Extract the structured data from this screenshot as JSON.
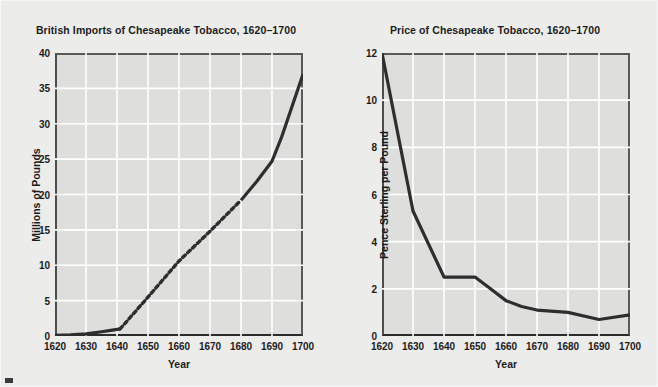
{
  "page": {
    "background_color": "#ececeb",
    "plot_background_color": "#dededc",
    "line_color": "#2e2e2e",
    "gridline_color": "#ffffff",
    "axis_color": "#2b2b2b",
    "text_color": "#1c1c1c"
  },
  "chart_data": [
    {
      "id": "imports",
      "type": "line",
      "title": "British Imports of Chesapeake Tobacco, 1620–1700",
      "xlabel": "Year",
      "ylabel": "Millions of Pounds",
      "xlim": [
        1620,
        1700
      ],
      "ylim": [
        0,
        40
      ],
      "xticks": [
        1620,
        1630,
        1640,
        1650,
        1660,
        1670,
        1680,
        1690,
        1700
      ],
      "yticks": [
        0,
        5,
        10,
        15,
        20,
        25,
        30,
        35,
        40
      ],
      "xtick_labels": [
        "1620",
        "1630",
        "1640",
        "1650",
        "1660",
        "1670",
        "1680",
        "1690",
        "1700"
      ],
      "ytick_labels": [
        "0",
        "5",
        "10",
        "15",
        "20",
        "25",
        "30",
        "35",
        "40"
      ],
      "grid": true,
      "legend": "none",
      "segments": [
        {
          "style": "solid",
          "note": "observed early data",
          "points": [
            {
              "x": 1620,
              "y": 0.1
            },
            {
              "x": 1625,
              "y": 0.15
            },
            {
              "x": 1630,
              "y": 0.3
            },
            {
              "x": 1635,
              "y": 0.6
            },
            {
              "x": 1638,
              "y": 0.8
            },
            {
              "x": 1641,
              "y": 1.0
            }
          ]
        },
        {
          "style": "dashed",
          "note": "interpolated / estimated interval",
          "points": [
            {
              "x": 1641,
              "y": 1.0
            },
            {
              "x": 1650,
              "y": 5.5
            },
            {
              "x": 1660,
              "y": 10.6
            },
            {
              "x": 1670,
              "y": 14.8
            },
            {
              "x": 1680,
              "y": 19.2
            }
          ]
        },
        {
          "style": "solid",
          "note": "observed late data",
          "points": [
            {
              "x": 1680,
              "y": 19.2
            },
            {
              "x": 1685,
              "y": 21.8
            },
            {
              "x": 1690,
              "y": 24.7
            },
            {
              "x": 1693,
              "y": 28.0
            },
            {
              "x": 1700,
              "y": 37.0
            }
          ]
        }
      ]
    },
    {
      "id": "price",
      "type": "line",
      "title": "Price of Chesapeake Tobacco, 1620–1700",
      "xlabel": "Year",
      "ylabel": "Pence Sterling per Pound",
      "xlim": [
        1620,
        1700
      ],
      "ylim": [
        0,
        12
      ],
      "xticks": [
        1620,
        1630,
        1640,
        1650,
        1660,
        1670,
        1680,
        1690,
        1700
      ],
      "yticks": [
        0,
        2,
        4,
        6,
        8,
        10,
        12
      ],
      "xtick_labels": [
        "1620",
        "1630",
        "1640",
        "1650",
        "1660",
        "1670",
        "1680",
        "1690",
        "1700"
      ],
      "ytick_labels": [
        "0",
        "2",
        "4",
        "6",
        "8",
        "10",
        "12"
      ],
      "grid": true,
      "legend": "none",
      "segments": [
        {
          "style": "solid",
          "note": "price series",
          "points": [
            {
              "x": 1620,
              "y": 12.0
            },
            {
              "x": 1630,
              "y": 5.3
            },
            {
              "x": 1640,
              "y": 2.5
            },
            {
              "x": 1650,
              "y": 2.5
            },
            {
              "x": 1655,
              "y": 2.0
            },
            {
              "x": 1660,
              "y": 1.5
            },
            {
              "x": 1665,
              "y": 1.25
            },
            {
              "x": 1670,
              "y": 1.1
            },
            {
              "x": 1680,
              "y": 1.0
            },
            {
              "x": 1690,
              "y": 0.7
            },
            {
              "x": 1700,
              "y": 0.9
            }
          ]
        }
      ]
    }
  ]
}
